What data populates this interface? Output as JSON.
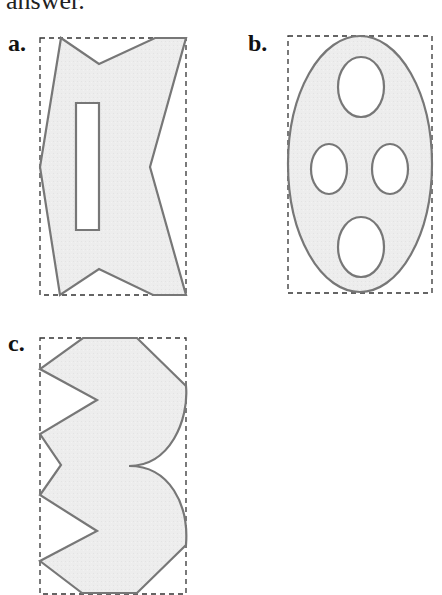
{
  "header_text": "answer.",
  "figures": [
    {
      "label": "a.",
      "shape": "concave polygon with rectangular hole"
    },
    {
      "label": "b.",
      "shape": "ellipse with four elliptical holes"
    },
    {
      "label": "c.",
      "shape": "polygon with zigzag left edge and curved right edge"
    }
  ],
  "colors": {
    "fill": "#ededed",
    "stroke": "#777777",
    "dash": "#333333",
    "hole": "#ffffff"
  }
}
